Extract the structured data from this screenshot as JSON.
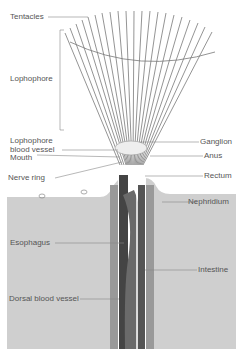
{
  "labels": {
    "tentacles": "Tentacles",
    "lophophore": "Lophophore",
    "lophophore_blood_vessel_1": "Lophophore",
    "lophophore_blood_vessel_2": "blood vessel",
    "mouth": "Mouth",
    "nerve_ring": "Nerve ring",
    "ganglion": "Ganglion",
    "anus": "Anus",
    "rectum": "Rectum",
    "nephridium": "Nephridium",
    "esophagus": "Esophagus",
    "intestine": "Intestine",
    "dorsal_blood_vessel": "Dorsal blood vessel"
  },
  "colors": {
    "sediment": "#cfcfcf",
    "body_dark": "#555555",
    "line": "#777777",
    "text": "#555555"
  }
}
